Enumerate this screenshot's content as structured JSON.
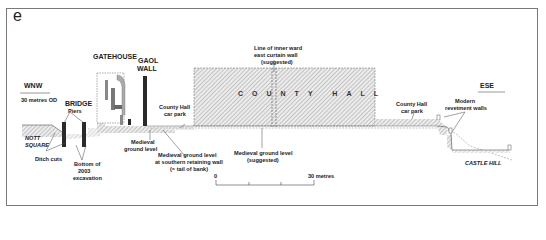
{
  "panel": {
    "letter": "e"
  },
  "orientation": {
    "west": "WNW",
    "east": "ESE",
    "datum": "30 metres OD"
  },
  "structures": {
    "gatehouse": "GATEHOUSE",
    "gaol_wall_1": "GAOL",
    "gaol_wall_2": "WALL",
    "bridge": "BRIDGE",
    "piers": "Piers",
    "county_hall": "COUNTY HALL"
  },
  "places": {
    "nott_square_1": "NOTT",
    "nott_square_2": "SQUARE",
    "castle_hill": "CASTLE HILL"
  },
  "annotations": {
    "ditch_cuts": "Ditch cuts",
    "excavation": [
      "Bottom of",
      "2003",
      "excavation"
    ],
    "medieval_ground": [
      "Medieval",
      "ground level"
    ],
    "retaining_wall": [
      "Medieval ground level",
      "at southern retaining wall",
      "(= tail of bank)"
    ],
    "car_park_west": [
      "County Hall",
      "car park"
    ],
    "car_park_east": [
      "County Hall",
      "car park"
    ],
    "inner_ward": [
      "Line of inner ward",
      "east curtain wall",
      "(suggested)"
    ],
    "medieval_suggested": [
      "Medieval ground level",
      "(suggested)"
    ],
    "revetment": [
      "Modern",
      "revetment walls"
    ]
  },
  "scale_bar": {
    "start": "0",
    "end": "30 metres"
  },
  "colors": {
    "hatch": "#9a9a9a",
    "dark_wall": "#2a2a2a",
    "frame": "#7a7a7a"
  }
}
